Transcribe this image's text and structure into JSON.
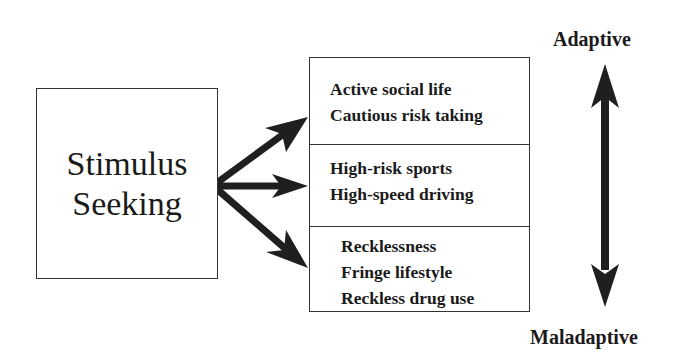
{
  "source": {
    "lines": [
      "Stimulus",
      "Seeking"
    ]
  },
  "outcomes": [
    {
      "items": [
        "Active social life",
        "Cautious risk taking"
      ]
    },
    {
      "items": [
        "High-risk sports",
        "High-speed driving"
      ]
    },
    {
      "items": [
        "Recklessness",
        "Fringe lifestyle",
        "Reckless drug use"
      ]
    }
  ],
  "scale": {
    "top_label": "Adaptive",
    "bottom_label": "Maladaptive"
  },
  "colors": {
    "arrow": "#1f1f1f",
    "border": "#333333",
    "text": "#1a1a1a"
  }
}
